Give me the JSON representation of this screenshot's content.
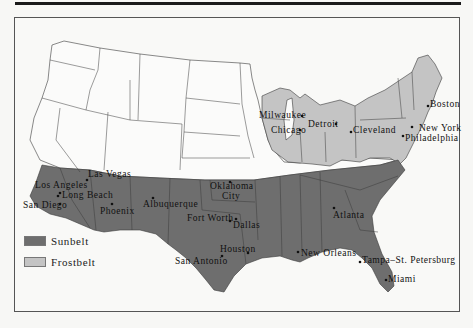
{
  "figure": {
    "type": "map"
  },
  "colors": {
    "sunbelt": "#6e6e6e",
    "frostbelt": "#c4c4c4",
    "other": "#fbfbfa",
    "border": "#3a3a3a"
  },
  "legend": {
    "items": [
      {
        "label": "Sunbelt",
        "color": "#6e6e6e"
      },
      {
        "label": "Frostbelt",
        "color": "#c4c4c4"
      }
    ]
  },
  "cities": {
    "sunbelt": [
      {
        "name": "Las Vegas",
        "x": 88,
        "y": 177
      },
      {
        "name": "Los Angeles",
        "x": 35,
        "y": 188
      },
      {
        "name": "Long Beach",
        "x": 62,
        "y": 198
      },
      {
        "name": "San Diego",
        "x": 23,
        "y": 208
      },
      {
        "name": "Phoenix",
        "x": 100,
        "y": 214
      },
      {
        "name": "Albuquerque",
        "x": 143,
        "y": 207
      },
      {
        "name": "Oklahoma City",
        "x": 210,
        "y": 189
      },
      {
        "name": "Fort Worth",
        "x": 187,
        "y": 221
      },
      {
        "name": "Dallas",
        "x": 233,
        "y": 228
      },
      {
        "name": "Houston",
        "x": 220,
        "y": 252
      },
      {
        "name": "San Antonio",
        "x": 175,
        "y": 264
      },
      {
        "name": "New Orleans",
        "x": 301,
        "y": 256
      },
      {
        "name": "Atlanta",
        "x": 333,
        "y": 218
      },
      {
        "name": "Tampa–St. Petersburg",
        "x": 362,
        "y": 263
      },
      {
        "name": "Miami",
        "x": 388,
        "y": 282
      }
    ],
    "frostbelt": [
      {
        "name": "Milwaukee",
        "x": 259,
        "y": 118
      },
      {
        "name": "Chicago",
        "x": 271,
        "y": 133
      },
      {
        "name": "Detroit",
        "x": 308,
        "y": 127
      },
      {
        "name": "Cleveland",
        "x": 353,
        "y": 133
      },
      {
        "name": "Boston",
        "x": 430,
        "y": 107
      },
      {
        "name": "New York",
        "x": 419,
        "y": 131
      },
      {
        "name": "Philadelphia",
        "x": 405,
        "y": 137
      }
    ]
  }
}
